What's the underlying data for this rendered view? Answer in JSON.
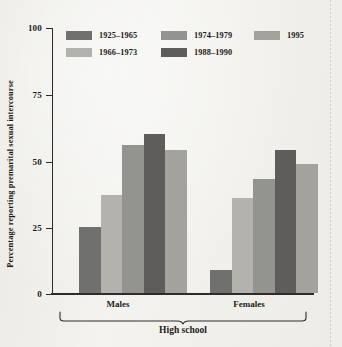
{
  "chart_data": {
    "type": "bar",
    "title": "",
    "xlabel": "High school",
    "ylabel": "Percentage reporting premarital sexual intercourse",
    "ylim": [
      0,
      100
    ],
    "yticks": [
      0,
      25,
      50,
      75,
      100
    ],
    "ytick_labels": [
      "0",
      "25",
      "50",
      "75",
      "100"
    ],
    "grid": false,
    "legend_position": "top-inside",
    "categories": [
      "Males",
      "Females"
    ],
    "group_bracket_label": "High school",
    "series": [
      {
        "name": "1925–1965",
        "color": "#70706e",
        "values": [
          25,
          9
        ]
      },
      {
        "name": "1966–1973",
        "color": "#b3b2ac",
        "values": [
          37,
          36
        ]
      },
      {
        "name": "1974–1979",
        "color": "#93938f",
        "values": [
          56,
          43
        ]
      },
      {
        "name": "1988–1990",
        "color": "#5e5d5c",
        "values": [
          60,
          54
        ]
      },
      {
        "name": "1995",
        "color": "#a3a29c",
        "values": [
          54,
          49
        ]
      }
    ],
    "legend_rows": [
      [
        "1925–1965",
        "1974–1979",
        "1995"
      ],
      [
        "1966–1973",
        "1988–1990"
      ]
    ]
  },
  "axis": {
    "y_title": "Percentage reporting premarital sexual intercourse",
    "tick_100": "100",
    "tick_75": "75",
    "tick_50": "50",
    "tick_25": "25",
    "tick_0": "0"
  },
  "groups": {
    "males_label": "Males",
    "females_label": "Females",
    "bracket_label": "High school"
  },
  "legend": {
    "row1": [
      {
        "label": "1925–1965",
        "color": "#70706e"
      },
      {
        "label": "1974–1979",
        "color": "#93938f"
      },
      {
        "label": "1995",
        "color": "#a3a29c"
      }
    ],
    "row2": [
      {
        "label": "1966–1973",
        "color": "#b3b2ac"
      },
      {
        "label": "1988–1990",
        "color": "#5e5d5c"
      }
    ]
  }
}
